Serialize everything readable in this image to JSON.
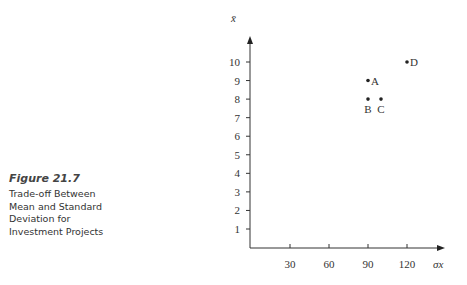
{
  "caption": {
    "figure_number": "Figure 21.7",
    "description_lines": [
      "Trade-off Between",
      "Mean and Standard",
      "Deviation for",
      "Investment Projects"
    ]
  },
  "chart_data": {
    "type": "scatter",
    "title": "Trade-off Between Mean and Standard Deviation for Investment Projects",
    "xlabel": "σx",
    "ylabel": "x̄",
    "x_ticks": [
      30,
      60,
      90,
      120
    ],
    "y_ticks": [
      1,
      2,
      3,
      4,
      5,
      6,
      7,
      8,
      9,
      10
    ],
    "xlim": [
      0,
      145
    ],
    "ylim": [
      0,
      11.5
    ],
    "grid": false,
    "points": [
      {
        "label": "A",
        "x": 90,
        "y": 9
      },
      {
        "label": "B",
        "x": 90,
        "y": 8
      },
      {
        "label": "C",
        "x": 100,
        "y": 8
      },
      {
        "label": "D",
        "x": 120,
        "y": 10
      }
    ]
  }
}
